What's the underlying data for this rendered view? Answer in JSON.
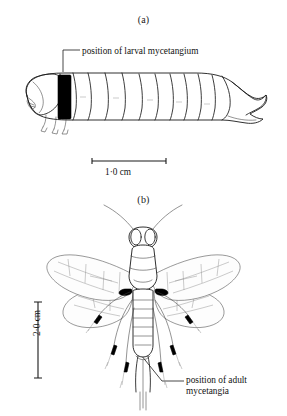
{
  "figure": {
    "background_color": "#ffffff",
    "ink_color": "#1a1a1a",
    "marker_color": "#000000",
    "panels": [
      {
        "id": "a",
        "label": "(a)",
        "subject": "woodwasp-larva-lateral-view",
        "callout": "position of larval mycetangium",
        "scale_bar": {
          "orientation": "horizontal",
          "label": "1·0 cm"
        }
      },
      {
        "id": "b",
        "label": "(b)",
        "subject": "woodwasp-adult-dorsal-view",
        "callout": "position of adult\nmycetangia",
        "scale_bar": {
          "orientation": "vertical",
          "label": "2·0 cm"
        }
      }
    ]
  }
}
